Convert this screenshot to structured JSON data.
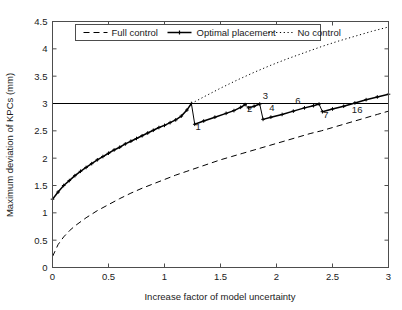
{
  "chart_data": {
    "type": "line",
    "title": "",
    "xlabel": "Increase factor of model uncertainty",
    "ylabel": "Maximum deviation of KPCs (mm)",
    "xlim": [
      0,
      3
    ],
    "ylim": [
      0,
      4.5
    ],
    "xticks": [
      0,
      0.5,
      1,
      1.5,
      2,
      2.5,
      3
    ],
    "xticklabels": [
      "0",
      "0.5",
      "1",
      "1.5",
      "2",
      "2.5",
      "3"
    ],
    "yticks": [
      0,
      0.5,
      1,
      1.5,
      2,
      2.5,
      3,
      3.5,
      4,
      4.5
    ],
    "yticklabels": [
      "0",
      "0.5",
      "1",
      "1.5",
      "2",
      "2.5",
      "3",
      "3.5",
      "4",
      "4.5"
    ],
    "grid": false,
    "legend_position": "upper center",
    "threshold": {
      "label": "tolerance-threshold",
      "y": 3.0,
      "style": "solid",
      "color": "#000000"
    },
    "series": [
      {
        "name": "Full control",
        "style": "dashed",
        "color": "#000000",
        "marker": "none",
        "points": [
          [
            0.0,
            0.2
          ],
          [
            0.05,
            0.42
          ],
          [
            0.1,
            0.56
          ],
          [
            0.15,
            0.67
          ],
          [
            0.2,
            0.76
          ],
          [
            0.3,
            0.91
          ],
          [
            0.4,
            1.04
          ],
          [
            0.5,
            1.15
          ],
          [
            0.6,
            1.26
          ],
          [
            0.7,
            1.36
          ],
          [
            0.8,
            1.45
          ],
          [
            0.9,
            1.53
          ],
          [
            1.0,
            1.61
          ],
          [
            1.1,
            1.69
          ],
          [
            1.2,
            1.76
          ],
          [
            1.3,
            1.83
          ],
          [
            1.4,
            1.9
          ],
          [
            1.5,
            1.97
          ],
          [
            1.6,
            2.03
          ],
          [
            1.7,
            2.09
          ],
          [
            1.8,
            2.15
          ],
          [
            1.9,
            2.21
          ],
          [
            2.0,
            2.27
          ],
          [
            2.1,
            2.33
          ],
          [
            2.2,
            2.39
          ],
          [
            2.3,
            2.45
          ],
          [
            2.4,
            2.5
          ],
          [
            2.5,
            2.56
          ],
          [
            2.6,
            2.62
          ],
          [
            2.7,
            2.68
          ],
          [
            2.8,
            2.74
          ],
          [
            2.9,
            2.8
          ],
          [
            3.0,
            2.86
          ]
        ]
      },
      {
        "name": "Optimal placement",
        "style": "solid-markers",
        "color": "#000000",
        "marker": "cross",
        "segments": [
          [
            [
              0.0,
              1.25
            ],
            [
              0.05,
              1.38
            ],
            [
              0.1,
              1.5
            ],
            [
              0.15,
              1.59
            ],
            [
              0.2,
              1.68
            ],
            [
              0.25,
              1.76
            ],
            [
              0.3,
              1.83
            ],
            [
              0.35,
              1.9
            ],
            [
              0.4,
              1.97
            ],
            [
              0.45,
              2.03
            ],
            [
              0.5,
              2.09
            ],
            [
              0.55,
              2.15
            ],
            [
              0.6,
              2.2
            ],
            [
              0.65,
              2.26
            ],
            [
              0.7,
              2.31
            ],
            [
              0.75,
              2.36
            ],
            [
              0.8,
              2.41
            ],
            [
              0.85,
              2.46
            ],
            [
              0.9,
              2.51
            ],
            [
              0.95,
              2.56
            ],
            [
              1.0,
              2.6
            ],
            [
              1.05,
              2.65
            ],
            [
              1.1,
              2.7
            ],
            [
              1.15,
              2.77
            ],
            [
              1.2,
              2.88
            ],
            [
              1.24,
              3.0
            ]
          ],
          [
            [
              1.27,
              2.62
            ],
            [
              1.35,
              2.68
            ],
            [
              1.45,
              2.75
            ],
            [
              1.55,
              2.82
            ],
            [
              1.62,
              2.87
            ],
            [
              1.68,
              2.93
            ],
            [
              1.72,
              2.98
            ]
          ],
          [
            [
              1.75,
              2.92
            ],
            [
              1.8,
              2.95
            ],
            [
              1.85,
              2.99
            ]
          ],
          [
            [
              1.88,
              2.71
            ],
            [
              1.95,
              2.75
            ],
            [
              2.05,
              2.8
            ],
            [
              2.15,
              2.86
            ],
            [
              2.25,
              2.92
            ],
            [
              2.33,
              2.96
            ],
            [
              2.38,
              2.99
            ]
          ],
          [
            [
              2.41,
              2.85
            ],
            [
              2.5,
              2.9
            ],
            [
              2.6,
              2.95
            ],
            [
              2.7,
              3.01
            ],
            [
              2.8,
              3.07
            ],
            [
              2.9,
              3.12
            ],
            [
              3.0,
              3.17
            ]
          ]
        ]
      },
      {
        "name": "No control",
        "style": "dotted",
        "color": "#000000",
        "marker": "none",
        "points": [
          [
            1.24,
            3.0
          ],
          [
            1.35,
            3.12
          ],
          [
            1.5,
            3.28
          ],
          [
            1.65,
            3.43
          ],
          [
            1.8,
            3.57
          ],
          [
            1.95,
            3.7
          ],
          [
            2.1,
            3.82
          ],
          [
            2.25,
            3.93
          ],
          [
            2.4,
            4.04
          ],
          [
            2.55,
            4.14
          ],
          [
            2.7,
            4.23
          ],
          [
            2.85,
            4.32
          ],
          [
            3.0,
            4.4
          ]
        ]
      }
    ],
    "annotations": [
      {
        "text": "1",
        "x": 1.3,
        "y": 2.52
      },
      {
        "text": "2",
        "x": 1.76,
        "y": 2.84
      },
      {
        "text": "3",
        "x": 1.9,
        "y": 3.09
      },
      {
        "text": "4",
        "x": 1.96,
        "y": 2.86
      },
      {
        "text": "6",
        "x": 2.19,
        "y": 3.0
      },
      {
        "text": "7",
        "x": 2.44,
        "y": 2.74
      },
      {
        "text": "16",
        "x": 2.72,
        "y": 2.82
      }
    ],
    "legend": [
      {
        "label": "Full control",
        "style": "dashed"
      },
      {
        "label": "Optimal placement",
        "style": "solid-markers"
      },
      {
        "label": "No control",
        "style": "dotted"
      }
    ]
  },
  "colors": {
    "axis": "#4d4d4d",
    "text": "#1a1a1a",
    "series": "#000000",
    "background": "#ffffff"
  }
}
